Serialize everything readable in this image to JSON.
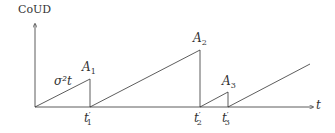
{
  "diagram": {
    "y_axis_label": "CoUD",
    "x_axis_label": "t",
    "slope_label": "σ²t",
    "peaks": [
      {
        "name": "A",
        "sub": "1",
        "x": 90,
        "y": 79
      },
      {
        "name": "A",
        "sub": "2",
        "x": 200,
        "y": 50
      },
      {
        "name": "A",
        "sub": "3",
        "x": 228,
        "y": 92
      }
    ],
    "ticks": [
      {
        "name": "t",
        "sub": "1",
        "prime": "′",
        "x": 90
      },
      {
        "name": "t",
        "sub": "2",
        "prime": "′",
        "x": 200
      },
      {
        "name": "t",
        "sub": "3",
        "prime": "′",
        "x": 228
      }
    ]
  }
}
